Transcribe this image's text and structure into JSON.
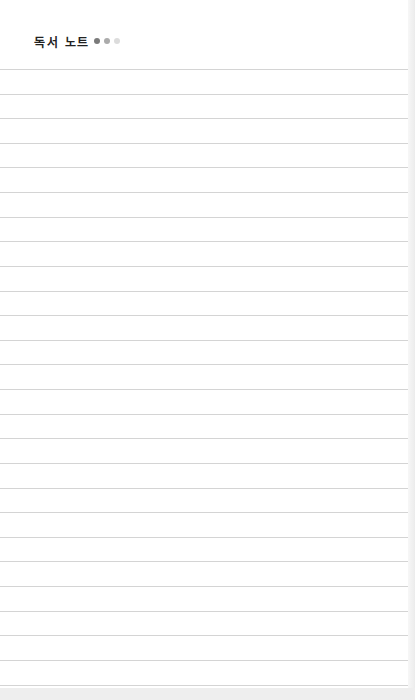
{
  "notebook": {
    "title": "독서 노트",
    "dots": [
      {
        "name": "dot-dark",
        "color": "#7a7a7a"
      },
      {
        "name": "dot-medium",
        "color": "#ababab"
      },
      {
        "name": "dot-light",
        "color": "#dcdcdc"
      }
    ],
    "ruled_lines": {
      "count": 26,
      "first_y": 69,
      "spacing": 24.62,
      "color": "#d4d4d4"
    },
    "colors": {
      "paper": "#ffffff",
      "background": "#f4f4f4",
      "title": "#222222"
    }
  }
}
